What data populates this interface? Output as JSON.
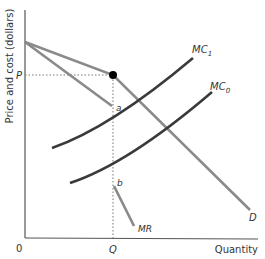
{
  "diagram": {
    "type": "economics-kinked-demand",
    "axes": {
      "ylabel": "Price and cost (dollars)",
      "xlabel": "Quantity",
      "origin_label": "0"
    },
    "labels": {
      "price": "P",
      "quantity": "Q",
      "point_a": "a",
      "point_b": "b",
      "demand": "D",
      "marginal_revenue": "MR",
      "mc1_main": "MC",
      "mc1_sub": "1",
      "mc0_main": "MC",
      "mc0_sub": "0"
    },
    "colors": {
      "axis": "#555555",
      "demand": "#8a8a8a",
      "mr": "#8a8a8a",
      "mc": "#3a3a3a",
      "guide": "#777777",
      "kink_point": "#000000"
    }
  }
}
